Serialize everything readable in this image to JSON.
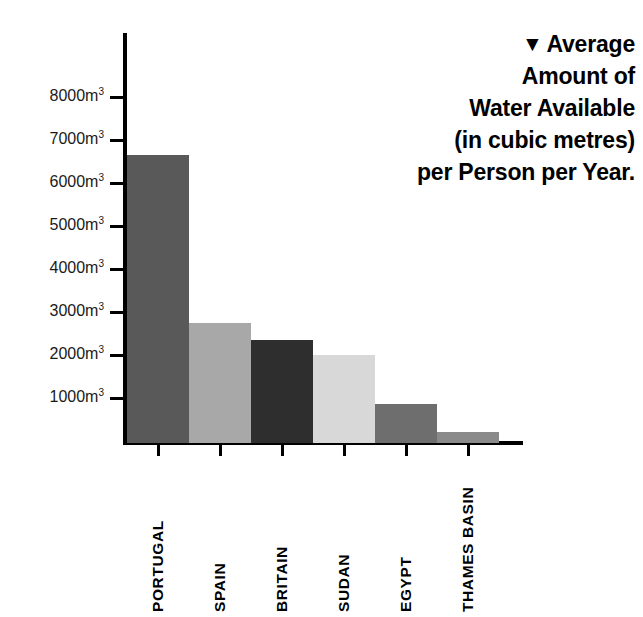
{
  "title": {
    "marker": "▼",
    "lines": [
      "Average",
      "Amount of",
      "Water Available",
      "(in cubic metres)",
      "per Person per Year."
    ],
    "full_text": "▼ Average Amount of Water Available (in cubic metres) per Person per Year."
  },
  "axis": {
    "y_tick_labels": [
      "1000m",
      "2000m",
      "3000m",
      "4000m",
      "5000m",
      "6000m",
      "7000m",
      "8000m"
    ],
    "y_unit_exponent": "3"
  },
  "chart_data": {
    "type": "bar",
    "xlabel": "",
    "ylabel": "Average Amount of Water Available (in cubic metres) per Person per Year",
    "yunit": "m³",
    "ylim": [
      0,
      8700
    ],
    "yticks": [
      1000,
      2000,
      3000,
      4000,
      5000,
      6000,
      7000,
      8000
    ],
    "ytick_labels": [
      "1000m³",
      "2000m³",
      "3000m³",
      "4000m³",
      "5000m³",
      "6000m³",
      "7000m³",
      "8000m³"
    ],
    "grid": false,
    "legend": "none",
    "categories": [
      "PORTUGAL",
      "SPAIN",
      "BRITAIN",
      "SUDAN",
      "EGYPT",
      "THAMES BASIN"
    ],
    "values": [
      6700,
      2800,
      2400,
      2050,
      900,
      250
    ],
    "colors": [
      "#595959",
      "#a8a8a8",
      "#2e2e2e",
      "#d8d8d8",
      "#6e6e6e",
      "#8a8a8a"
    ],
    "bars": [
      {
        "label": "PORTUGAL",
        "value": 6700,
        "color": "#595959"
      },
      {
        "label": "SPAIN",
        "value": 2800,
        "color": "#a8a8a8"
      },
      {
        "label": "BRITAIN",
        "value": 2400,
        "color": "#2e2e2e"
      },
      {
        "label": "SUDAN",
        "value": 2050,
        "color": "#d8d8d8"
      },
      {
        "label": "EGYPT",
        "value": 900,
        "color": "#6e6e6e"
      },
      {
        "label": "THAMES BASIN",
        "value": 250,
        "color": "#8a8a8a"
      }
    ]
  }
}
